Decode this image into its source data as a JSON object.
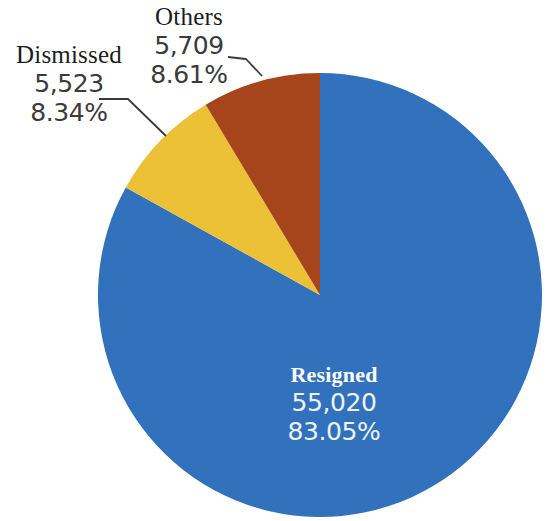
{
  "chart_data": {
    "type": "pie",
    "title": "",
    "subtitle": "",
    "xlabel": "",
    "ylabel": "",
    "legend_position": "none",
    "grid": false,
    "total": 66252,
    "start_angle_deg": 0,
    "direction": "clockwise",
    "categories": [
      "Resigned",
      "Dismissed",
      "Others"
    ],
    "values": [
      55020,
      5523,
      5709
    ],
    "percentages": [
      83.05,
      8.34,
      8.61
    ],
    "value_labels": [
      "55,020",
      "5,523",
      "5,709"
    ],
    "percent_labels": [
      "83.05%",
      "8.34%",
      "8.61%"
    ],
    "colors": [
      "#3172BE",
      "#EFC335",
      "#A8451A"
    ],
    "slices": [
      {
        "name": "Resigned",
        "value": 55020,
        "value_label": "55,020",
        "percent": 83.05,
        "percent_label": "83.05%",
        "color": "#3172BE",
        "label_placement": "inside",
        "label_color": "#ffffff"
      },
      {
        "name": "Dismissed",
        "value": 5523,
        "value_label": "5,523",
        "percent": 8.34,
        "percent_label": "8.34%",
        "color": "#EFC335",
        "label_placement": "outside-left",
        "label_color": "#2b2b2b"
      },
      {
        "name": "Others",
        "value": 5709,
        "value_label": "5,709",
        "percent": 8.61,
        "percent_label": "8.61%",
        "color": "#A8451A",
        "label_placement": "outside-top",
        "label_color": "#2b2b2b"
      }
    ]
  },
  "labels": {
    "resigned": {
      "name": "Resigned",
      "value": "55,020",
      "percent": "83.05%"
    },
    "dismissed": {
      "name": "Dismissed",
      "value": "5,523",
      "percent": "8.34%"
    },
    "others": {
      "name": "Others",
      "value": "5,709",
      "percent": "8.61%"
    }
  },
  "geometry": {
    "center_x": 320,
    "center_y": 295,
    "radius": 222
  },
  "palette": {
    "background": "#ffffff",
    "resigned": "#3172BE",
    "dismissed": "#EFC335",
    "others": "#A8451A",
    "leader_line": "#3b3b3b",
    "text": "#2b2b2b",
    "inside_text": "#ffffff"
  }
}
